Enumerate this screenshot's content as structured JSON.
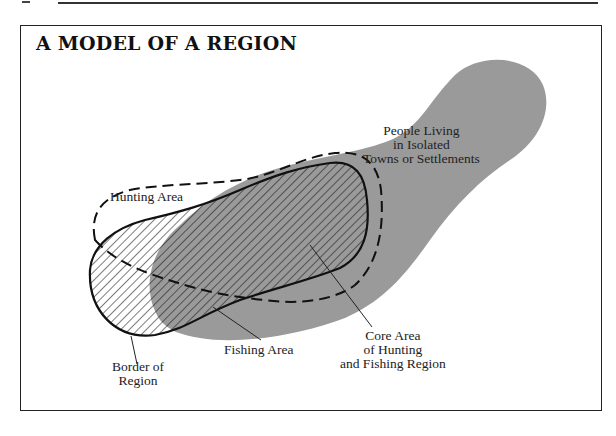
{
  "figure": {
    "title": "A MODEL OF A REGION"
  },
  "labels": {
    "settlements": "People Living\nin Isolated\nTowns or Settlements",
    "hunting_area": "Hunting Area",
    "border_of_region": "Border of\nRegion",
    "fishing_area": "Fishing Area",
    "core_area": "Core Area\nof Hunting\nand Fishing Region"
  },
  "colors": {
    "settlement_fill": "#9a9a9a",
    "outline": "#111111",
    "hatch": "#111111",
    "background": "#ffffff"
  },
  "legend_semantics": {
    "gray_shape": "People Living in Isolated Towns or Settlements",
    "dashed_outline": "Hunting Area",
    "solid_outline_hatched": "Fishing Area / Border of Region",
    "overlap": "Core Area of Hunting and Fishing Region"
  }
}
